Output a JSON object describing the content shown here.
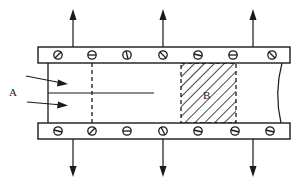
{
  "diagram": {
    "type": "schematic",
    "labels": {
      "a": "A",
      "b": "B"
    },
    "caption": "",
    "colors": {
      "ink": "#1a1a1a",
      "background": "#ffffff"
    },
    "top_bar": {
      "screw_count": 7,
      "arrows": 3,
      "arrow_direction": "up"
    },
    "bottom_bar": {
      "screw_count": 7,
      "arrows": 3,
      "arrow_direction": "down"
    },
    "inflow_arrows": 2,
    "hatched_region": "B",
    "icons": [
      "screw-icon",
      "arrow-up-icon",
      "arrow-down-icon",
      "arrow-right-icon"
    ]
  }
}
